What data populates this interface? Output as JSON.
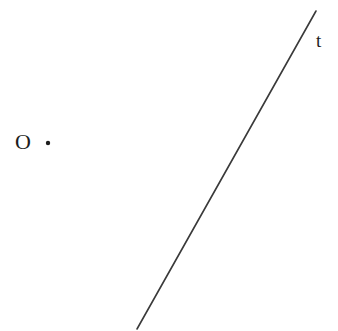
{
  "figure": {
    "width": 338,
    "height": 331,
    "background_color": "#ffffff",
    "stroke_color": "#3a3a3a",
    "text_color": "#1d1d1d",
    "labels": {
      "line_label": "t",
      "point_label": "O"
    },
    "line": {
      "name": "t",
      "x1": 316,
      "y1": 11,
      "x2": 137,
      "y2": 329,
      "stroke_width": 1.6
    },
    "point": {
      "name": "O",
      "cx": 48,
      "cy": 143,
      "radius": 2.2
    }
  }
}
